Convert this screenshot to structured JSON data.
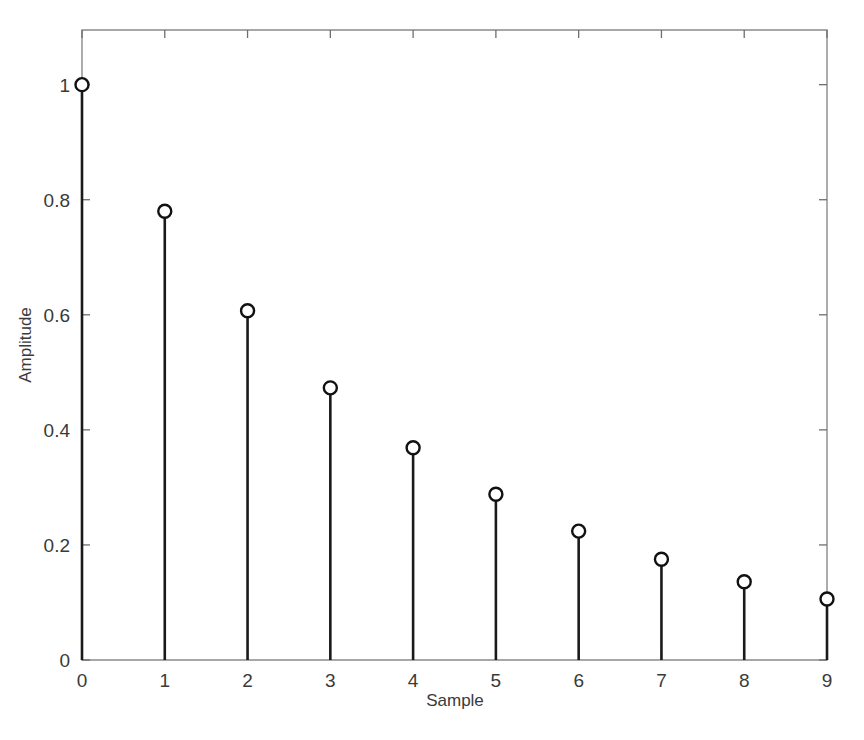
{
  "figure": {
    "background_color": "#ffffff",
    "axis_color": "#8a8a8a",
    "data_color": "#1a1a1a"
  },
  "chart_data": {
    "type": "line",
    "plot_style": "stem",
    "title": "",
    "subtitle": "",
    "xlabel": "Sample",
    "ylabel": "Amplitude",
    "x": [
      0,
      1,
      2,
      3,
      4,
      5,
      6,
      7,
      8,
      9
    ],
    "values": [
      1.0,
      0.78,
      0.607,
      0.473,
      0.369,
      0.288,
      0.224,
      0.175,
      0.136,
      0.106
    ],
    "series": [
      {
        "name": "Impulse response",
        "values": [
          1.0,
          0.78,
          0.607,
          0.473,
          0.369,
          0.288,
          0.224,
          0.175,
          0.136,
          0.106
        ]
      }
    ],
    "xlim": [
      0,
      9
    ],
    "ylim": [
      0,
      1.095
    ],
    "xticks": [
      0,
      1,
      2,
      3,
      4,
      5,
      6,
      7,
      8,
      9
    ],
    "xtick_labels": [
      "0",
      "1",
      "2",
      "3",
      "4",
      "5",
      "6",
      "7",
      "8",
      "9"
    ],
    "yticks": [
      0,
      0.2,
      0.4,
      0.6,
      0.8,
      1
    ],
    "ytick_labels": [
      "0",
      "0.2",
      "0.4",
      "0.6",
      "0.8",
      "1"
    ],
    "grid": false,
    "legend": null,
    "legend_position": "none",
    "marker": "circle-open",
    "annotations": []
  }
}
